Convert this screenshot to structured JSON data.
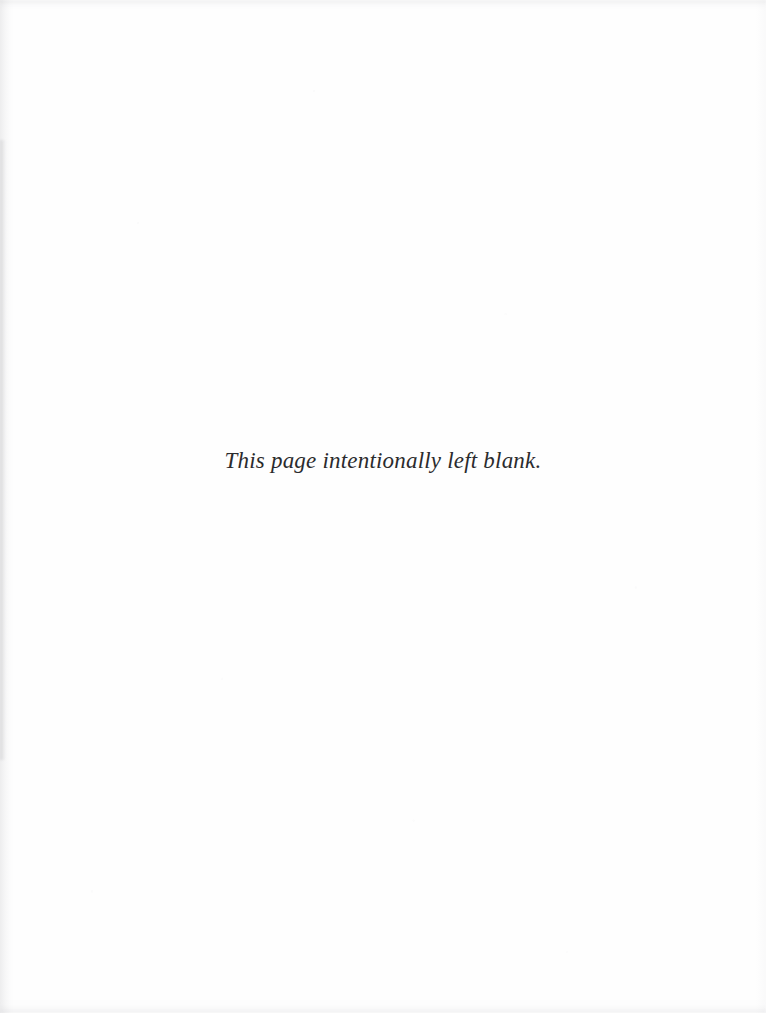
{
  "page": {
    "kind": "scanned-book-page",
    "paper_color": "#fefefe",
    "text_color": "#2b2b2d",
    "notice": "This page intentionally left blank.",
    "header": "",
    "footer": "",
    "page_number": ""
  }
}
